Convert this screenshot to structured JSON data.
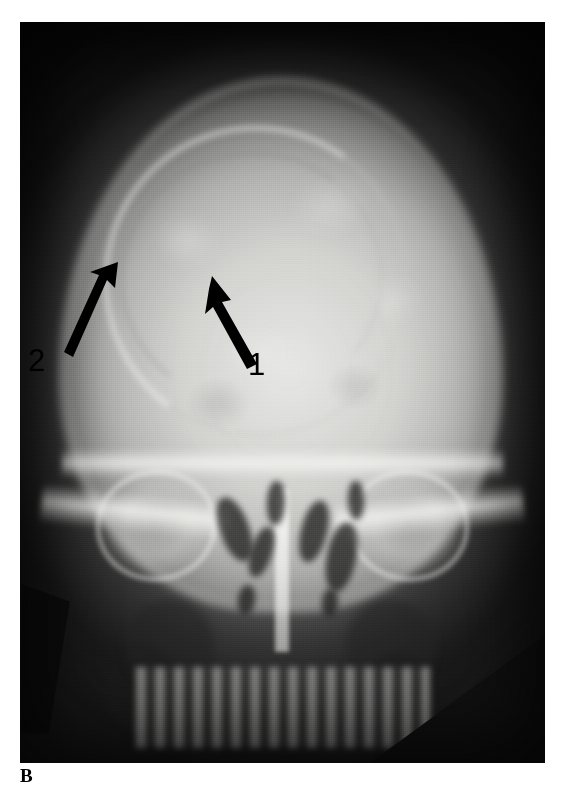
{
  "figure": {
    "panel_label": "B",
    "modality": "radiograph",
    "view": "skull-pa-caldwell",
    "caption_visible": false
  },
  "plate": {
    "background_color": "#101010",
    "bone_color": "#e8e8e6",
    "soft_tissue_color": "#b4b4b2",
    "film_corner_color": "#101010",
    "bounds": {
      "x": 20,
      "y": 22,
      "width": 525,
      "height": 741
    }
  },
  "annotations": [
    {
      "id": "annotation-1",
      "label": "1",
      "icon": "arrow-up-left-icon",
      "color": "#000000",
      "tip": {
        "x": 212,
        "y": 276
      },
      "tail": {
        "x": 255,
        "y": 365
      },
      "label_position": {
        "x": 248,
        "y": 349
      }
    },
    {
      "id": "annotation-2",
      "label": "2",
      "icon": "arrow-up-right-icon",
      "color": "#000000",
      "tip": {
        "x": 118,
        "y": 262
      },
      "tail": {
        "x": 72,
        "y": 358
      },
      "label_position": {
        "x": 28,
        "y": 345
      }
    }
  ],
  "anatomy_features": [
    {
      "name": "cranial-vault",
      "description": "calvarium"
    },
    {
      "name": "lesion-margin-arc",
      "description": "arcuate lesion border in frontal/parietal vault"
    },
    {
      "name": "orbit-left",
      "description": "left orbital rim"
    },
    {
      "name": "orbit-right",
      "description": "right orbital rim"
    },
    {
      "name": "petrous-ridge-left",
      "description": "left petrous ridge"
    },
    {
      "name": "petrous-ridge-right",
      "description": "right petrous ridge"
    },
    {
      "name": "nasal-septum",
      "description": "nasal septum"
    },
    {
      "name": "maxillary-sinus-left",
      "description": "left maxillary sinus"
    },
    {
      "name": "maxillary-sinus-right",
      "description": "right maxillary sinus"
    },
    {
      "name": "collimation-arc",
      "description": "collimator edge arc across upper film"
    }
  ],
  "air_cells": [
    {
      "x": 38.0,
      "y": 64.0,
      "w": 5.5,
      "h": 9.0
    },
    {
      "x": 44.0,
      "y": 68.0,
      "w": 4.0,
      "h": 7.0
    },
    {
      "x": 53.5,
      "y": 64.5,
      "w": 5.0,
      "h": 8.5
    },
    {
      "x": 58.5,
      "y": 67.5,
      "w": 5.5,
      "h": 9.5
    },
    {
      "x": 41.5,
      "y": 76.0,
      "w": 3.2,
      "h": 4.0
    },
    {
      "x": 57.5,
      "y": 76.5,
      "w": 3.0,
      "h": 3.6
    },
    {
      "x": 47.0,
      "y": 62.0,
      "w": 3.4,
      "h": 6.0
    },
    {
      "x": 62.5,
      "y": 62.0,
      "w": 3.0,
      "h": 5.2
    },
    {
      "x": 16.0,
      "y": 84.0,
      "w": 14.0,
      "h": 12.0
    },
    {
      "x": 66.0,
      "y": 85.0,
      "w": 13.0,
      "h": 11.0
    },
    {
      "x": 30.0,
      "y": 92.0,
      "w": 9.0,
      "h": 8.0
    },
    {
      "x": 56.0,
      "y": 93.0,
      "w": 8.0,
      "h": 7.0
    }
  ]
}
